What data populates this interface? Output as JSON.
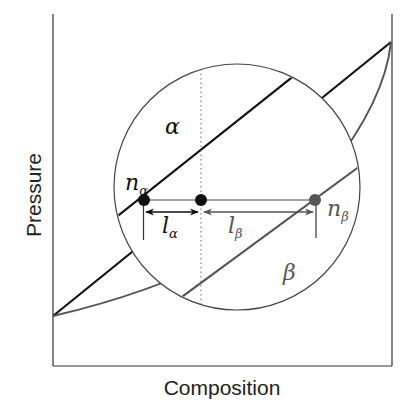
{
  "diagram": {
    "type": "phase-diagram-lever-rule",
    "x_axis_label": "Composition",
    "y_axis_label": "Pressure",
    "region_labels": {
      "alpha": "α",
      "beta": "β"
    },
    "points": {
      "n_alpha": {
        "base": "n",
        "sub": "α"
      },
      "n_beta": {
        "base": "n",
        "sub": "β"
      }
    },
    "lever_arms": {
      "l_alpha": {
        "base": "l",
        "sub": "α"
      },
      "l_beta": {
        "base": "l",
        "sub": "β"
      }
    },
    "colors": {
      "alpha_line": "#111111",
      "beta_line": "#555555",
      "axis": "#333333",
      "circle": "#444444"
    }
  }
}
